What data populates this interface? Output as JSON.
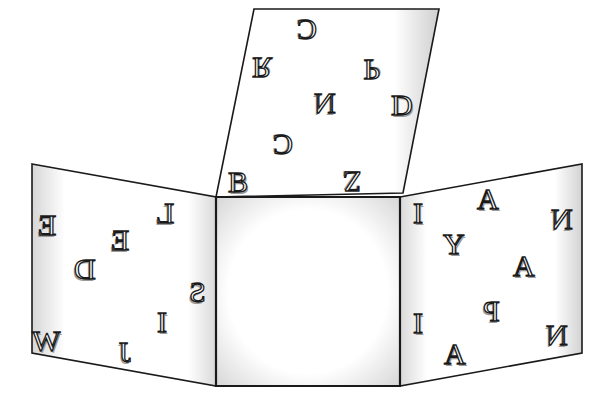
{
  "diagram": {
    "type": "cube-net",
    "colors": {
      "outline": "#1a1a1a",
      "face_fill": "#ffffff",
      "shade": "#cfcfcf",
      "letter_shadow": "#9a9a9a"
    },
    "faces": {
      "top": {
        "shape": "parallelogram",
        "points": [
          [
            254,
            9
          ],
          [
            439,
            9
          ],
          [
            403,
            193
          ],
          [
            216,
            197
          ]
        ],
        "letters": [
          {
            "char": "C",
            "x": 307,
            "y": 30,
            "rotate": 180,
            "mirror": false
          },
          {
            "char": "R",
            "x": 262,
            "y": 68,
            "rotate": 180,
            "mirror": true
          },
          {
            "char": "P",
            "x": 372,
            "y": 70,
            "rotate": 180,
            "mirror": true
          },
          {
            "char": "N",
            "x": 325,
            "y": 103,
            "rotate": 0,
            "mirror": true
          },
          {
            "char": "D",
            "x": 402,
            "y": 105,
            "rotate": 0,
            "mirror": false
          },
          {
            "char": "C",
            "x": 283,
            "y": 145,
            "rotate": 180,
            "mirror": false
          },
          {
            "char": "B",
            "x": 238,
            "y": 182,
            "rotate": 0,
            "mirror": false
          },
          {
            "char": "Z",
            "x": 352,
            "y": 182,
            "rotate": 180,
            "mirror": false
          }
        ]
      },
      "left": {
        "shape": "quadrilateral",
        "points": [
          [
            32,
            164
          ],
          [
            216,
            197
          ],
          [
            216,
            386
          ],
          [
            32,
            353
          ]
        ],
        "letters": [
          {
            "char": "L",
            "x": 165,
            "y": 213,
            "rotate": 0,
            "mirror": true
          },
          {
            "char": "E",
            "x": 47,
            "y": 225,
            "rotate": 0,
            "mirror": true
          },
          {
            "char": "E",
            "x": 120,
            "y": 240,
            "rotate": 0,
            "mirror": true
          },
          {
            "char": "D",
            "x": 85,
            "y": 269,
            "rotate": 0,
            "mirror": true
          },
          {
            "char": "S",
            "x": 197,
            "y": 292,
            "rotate": 0,
            "mirror": true
          },
          {
            "char": "I",
            "x": 162,
            "y": 322,
            "rotate": 0,
            "mirror": false
          },
          {
            "char": "W",
            "x": 46,
            "y": 341,
            "rotate": 0,
            "mirror": false
          },
          {
            "char": "J",
            "x": 125,
            "y": 352,
            "rotate": 0,
            "mirror": true
          }
        ]
      },
      "center": {
        "shape": "square",
        "points": [
          [
            216,
            197
          ],
          [
            400,
            197
          ],
          [
            400,
            386
          ],
          [
            216,
            386
          ]
        ],
        "letters": []
      },
      "right": {
        "shape": "quadrilateral",
        "points": [
          [
            400,
            197
          ],
          [
            582,
            164
          ],
          [
            582,
            353
          ],
          [
            400,
            386
          ]
        ],
        "letters": [
          {
            "char": "I",
            "x": 418,
            "y": 213,
            "rotate": 0,
            "mirror": false
          },
          {
            "char": "A",
            "x": 488,
            "y": 199,
            "rotate": 0,
            "mirror": false
          },
          {
            "char": "N",
            "x": 562,
            "y": 219,
            "rotate": 0,
            "mirror": true
          },
          {
            "char": "Y",
            "x": 454,
            "y": 244,
            "rotate": 0,
            "mirror": false
          },
          {
            "char": "A",
            "x": 524,
            "y": 266,
            "rotate": 0,
            "mirror": false
          },
          {
            "char": "P",
            "x": 491,
            "y": 311,
            "rotate": 0,
            "mirror": true
          },
          {
            "char": "I",
            "x": 418,
            "y": 323,
            "rotate": 0,
            "mirror": false
          },
          {
            "char": "N",
            "x": 557,
            "y": 335,
            "rotate": 0,
            "mirror": true
          },
          {
            "char": "A",
            "x": 455,
            "y": 354,
            "rotate": 0,
            "mirror": false
          }
        ]
      }
    }
  }
}
